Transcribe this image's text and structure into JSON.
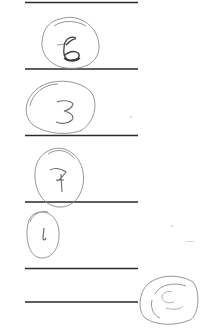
{
  "document": {
    "type": "handwritten ruled sheet",
    "ink_color": "#2a2a2a",
    "pencil_color": "#8a8a8a",
    "background": "#ffffff"
  },
  "rules": [
    {
      "y": 2,
      "x1": 25,
      "x2": 138
    },
    {
      "y": 69,
      "x1": 25,
      "x2": 138
    },
    {
      "y": 135,
      "x1": 25,
      "x2": 138
    },
    {
      "y": 202,
      "x1": 25,
      "x2": 138
    },
    {
      "y": 268,
      "x1": 25,
      "x2": 138
    },
    {
      "y": 302,
      "x1": 25,
      "x2": 138
    }
  ],
  "circled_digits": [
    {
      "label": "6",
      "cx": 70,
      "cy": 45,
      "rx": 30,
      "ry": 27,
      "tx": 70,
      "ty": 52
    },
    {
      "label": "3",
      "cx": 60,
      "cy": 105,
      "rx": 35,
      "ry": 27,
      "tx": 63,
      "ty": 112
    },
    {
      "label": "7",
      "cx": 59,
      "cy": 174,
      "rx": 24,
      "ry": 28,
      "tx": 61,
      "ty": 182
    },
    {
      "label": "1",
      "cx": 42,
      "cy": 233,
      "rx": 18,
      "ry": 25,
      "tx": 44,
      "ty": 240
    },
    {
      "label": "6",
      "cx": 166,
      "cy": 298,
      "rx": 30,
      "ry": 25,
      "tx": 165,
      "ty": 304
    }
  ]
}
